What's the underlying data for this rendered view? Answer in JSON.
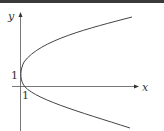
{
  "diagram": {
    "type": "parabola-graph",
    "axes": {
      "x_label": "x",
      "y_label": "y"
    },
    "annotations": {
      "y_intercept_label": "1",
      "x_intercept_label": "1"
    },
    "colors": {
      "curve": "#444444",
      "axis": "#555555",
      "label": "#333333"
    }
  }
}
